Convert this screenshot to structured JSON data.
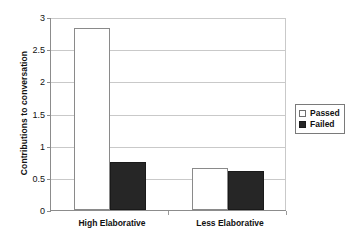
{
  "chart_data": {
    "type": "bar",
    "title": "",
    "xlabel": "",
    "ylabel": "Contributions to conversation",
    "categories": [
      "High Elaborative",
      "Less Elaborative"
    ],
    "series": [
      {
        "name": "Passed",
        "values": [
          2.83,
          0.65
        ],
        "color": "#ffffff"
      },
      {
        "name": "Failed",
        "values": [
          0.75,
          0.61
        ],
        "color": "#262626"
      }
    ],
    "ylim": [
      0,
      3
    ],
    "yticks": [
      0,
      0.5,
      1,
      1.5,
      2,
      2.5,
      3
    ],
    "ytick_labels": [
      "0",
      "0.5",
      "1",
      "1.5",
      "2",
      "2.5",
      "3"
    ],
    "grid": "horizontal",
    "legend_position": "right"
  },
  "axes": {
    "y_title": "Contributions to conversation",
    "tick_labels": [
      "3",
      "2.5",
      "2",
      "1.5",
      "1",
      "0.5",
      "0"
    ]
  },
  "legend": {
    "entries": [
      {
        "label": "Passed",
        "swatch": "white-square-icon"
      },
      {
        "label": "Failed",
        "swatch": "black-square-icon"
      }
    ]
  },
  "categories": {
    "first": "High Elaborative",
    "second": "Less Elaborative"
  }
}
